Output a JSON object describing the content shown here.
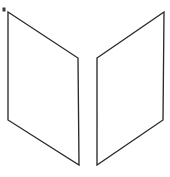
{
  "figure": {
    "width": 170,
    "height": 177,
    "background_color": "#ffffff",
    "stroke_color": "#2b2b2b",
    "stroke_width": 1.35,
    "fill_color": "#ffffff",
    "shapes": [
      {
        "name": "left-panel",
        "label": "Left panel",
        "type": "quadrilateral",
        "points": "8,12 78,58 79,165 8,120"
      },
      {
        "name": "right-panel",
        "label": "Right panel",
        "type": "quadrilateral",
        "points": "97,58 164,12 163,120 97,165"
      }
    ],
    "marks": [
      {
        "name": "corner-speck",
        "label": "Stray speck",
        "x": 2.5,
        "y": 7.5,
        "width": 3,
        "height": 4,
        "color": "#3a3a3a"
      }
    ]
  }
}
